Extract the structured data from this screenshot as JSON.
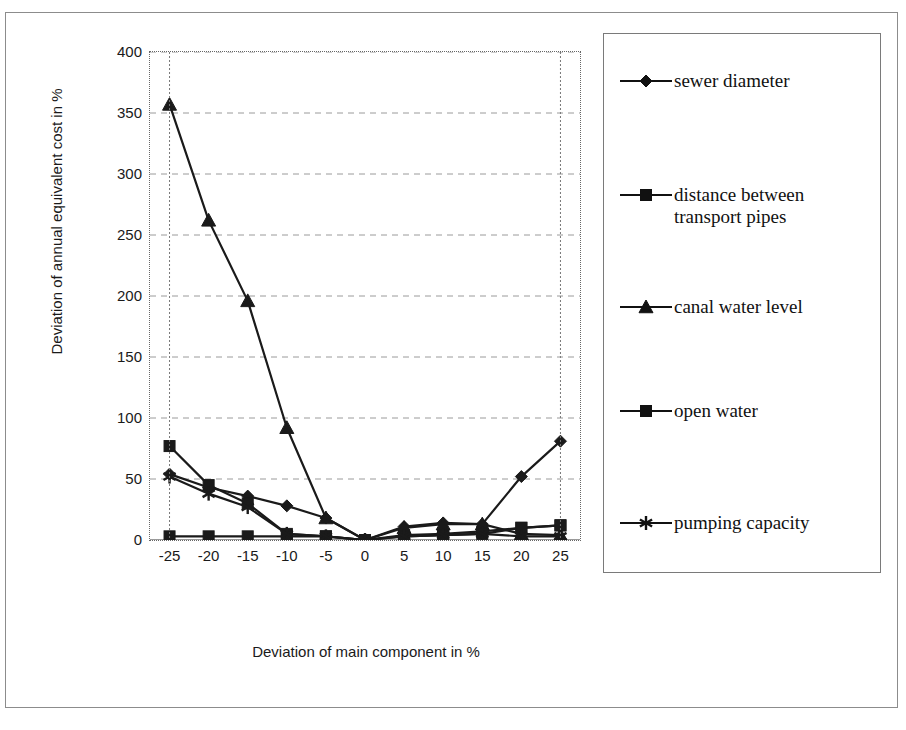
{
  "chart_data": {
    "type": "line",
    "title": "",
    "xlabel": "Deviation of main component in %",
    "ylabel": "Deviation of annual equivalent cost in %",
    "categories": [
      "-25",
      "-20",
      "-15",
      "-10",
      "-5",
      "0",
      "5",
      "10",
      "15",
      "20",
      "25"
    ],
    "ylim": [
      0,
      400
    ],
    "yticks": [
      "0",
      "50",
      "100",
      "150",
      "200",
      "250",
      "300",
      "350",
      "400"
    ],
    "grid": "horizontal-dashed",
    "legend_position": "right",
    "series": [
      {
        "name": "sewer diameter",
        "marker": "diamond",
        "color": "#1a1a1a",
        "values": [
          54,
          43,
          36,
          28,
          18,
          0,
          11,
          14,
          13,
          52,
          81
        ]
      },
      {
        "name": "distance between transport pipes",
        "marker": "square",
        "color": "#1a1a1a",
        "values": [
          77,
          45,
          30,
          5,
          3,
          0,
          4,
          5,
          7,
          10,
          12
        ]
      },
      {
        "name": "canal water level",
        "marker": "triangle",
        "color": "#1a1a1a",
        "values": [
          357,
          262,
          196,
          92,
          18,
          0,
          10,
          13,
          13,
          5,
          4
        ]
      },
      {
        "name": "open water",
        "marker": "square",
        "color": "#1a1a1a",
        "values": [
          3,
          3,
          3,
          3,
          3,
          0,
          3,
          4,
          5,
          10,
          12
        ]
      },
      {
        "name": "pumping capacity",
        "marker": "asterisk",
        "color": "#1a1a1a",
        "values": [
          52,
          38,
          27,
          5,
          3,
          0,
          3,
          4,
          5,
          3,
          3
        ]
      }
    ]
  },
  "legend": {
    "entries": [
      {
        "label": "sewer diameter",
        "marker": "diamond"
      },
      {
        "label": "distance between\ntransport pipes",
        "marker": "square"
      },
      {
        "label": "canal water level",
        "marker": "triangle"
      },
      {
        "label": "open water",
        "marker": "square"
      },
      {
        "label": "pumping capacity",
        "marker": "asterisk"
      }
    ]
  }
}
